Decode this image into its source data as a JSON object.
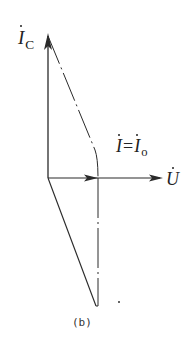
{
  "figure": {
    "caption": "(b)",
    "colors": {
      "line": "#2a2a2a",
      "background": "#ffffff"
    }
  },
  "labels": {
    "ic_symbol": "I",
    "ic_subscript": "C",
    "i_symbol": "I",
    "equals": "=",
    "io_symbol": "I",
    "io_subscript": "o",
    "u_symbol": "U"
  },
  "vectors": [
    {
      "name": "I_C",
      "from": [
        48,
        178
      ],
      "to": [
        48,
        35
      ],
      "style": "solid",
      "arrow": true
    },
    {
      "name": "I",
      "from": [
        48,
        178
      ],
      "to": [
        98,
        178
      ],
      "style": "solid",
      "arrow": true
    },
    {
      "name": "U",
      "from": [
        98,
        178
      ],
      "to": [
        162,
        178
      ],
      "style": "solid",
      "arrow": true
    },
    {
      "name": "I_L",
      "from": [
        48,
        178
      ],
      "to": [
        97,
        306
      ],
      "style": "solid",
      "arrow": false
    }
  ],
  "construction_lines": [
    {
      "name": "ic-to-i-dashdot",
      "from": [
        48,
        35
      ],
      "to": [
        98,
        178
      ],
      "style": "dash-dot"
    },
    {
      "name": "i-to-bottom-dashdot",
      "from": [
        98,
        178
      ],
      "to": [
        98,
        306
      ],
      "style": "dash-dot"
    }
  ]
}
